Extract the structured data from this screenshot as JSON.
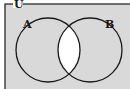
{
  "diagram": {
    "type": "venn",
    "universe_label": "U",
    "sets": [
      {
        "label": "A"
      },
      {
        "label": "B"
      }
    ],
    "shaded_region": "complement of A ∩ B",
    "colors": {
      "shaded": "#d9d9d9",
      "unshaded": "#ffffff",
      "stroke": "#1a1a1a"
    }
  }
}
